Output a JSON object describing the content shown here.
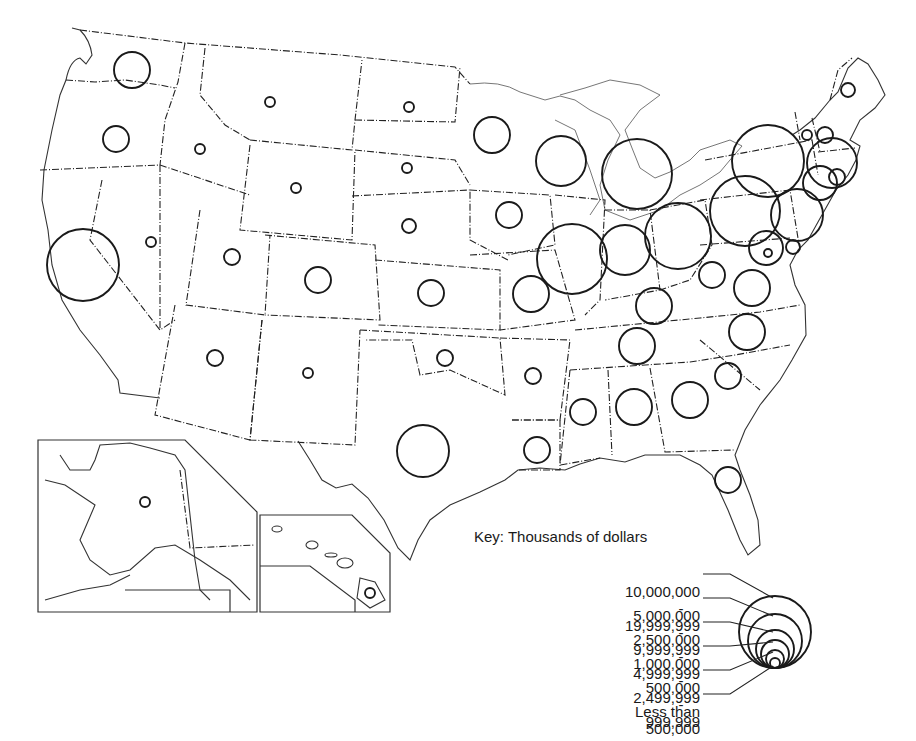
{
  "map": {
    "subject": "United States, by state — proportional circles",
    "insets": [
      "Alaska",
      "Hawaii"
    ]
  },
  "key": {
    "title": "Key:  Thousands of dollars",
    "rows": [
      {
        "low": "10,000,000",
        "sep": "-",
        "high": "19,999,999",
        "radius": 36
      },
      {
        "low": "5,000,000",
        "sep": "-",
        "high": "9,999,999",
        "radius": 27
      },
      {
        "low": "2,500,000",
        "sep": "-",
        "high": "4,999,999",
        "radius": 19
      },
      {
        "low": "1,000,000",
        "sep": "-",
        "high": "2,499,999",
        "radius": 14
      },
      {
        "low": "500,000",
        "sep": "-",
        "high": "999,999",
        "radius": 9
      },
      {
        "low": "Less than",
        "sep": "",
        "high": "500,000",
        "radius": 5
      }
    ]
  },
  "chart_data": {
    "type": "proportional-symbol-map",
    "title": "Key: Thousands of dollars",
    "legend": [
      "10,000,000 - 19,999,999",
      "5,000,000 - 9,999,999",
      "2,500,000 - 4,999,999",
      "1,000,000 - 2,499,999",
      "500,000 - 999,999",
      "Less than 500,000"
    ],
    "states": [
      {
        "state": "California",
        "class": "10,000,000 - 19,999,999",
        "cx": 83,
        "cy": 265,
        "r": 36
      },
      {
        "state": "New York",
        "class": "10,000,000 - 19,999,999",
        "cx": 768,
        "cy": 161,
        "r": 36
      },
      {
        "state": "Michigan",
        "class": "5,000,000 - 9,999,999",
        "cx": 637,
        "cy": 174,
        "r": 35
      },
      {
        "state": "Pennsylvania",
        "class": "5,000,000 - 9,999,999",
        "cx": 745,
        "cy": 211,
        "r": 35
      },
      {
        "state": "Illinois",
        "class": "5,000,000 - 9,999,999",
        "cx": 572,
        "cy": 259,
        "r": 35
      },
      {
        "state": "Ohio",
        "class": "5,000,000 - 9,999,999",
        "cx": 678,
        "cy": 236,
        "r": 33
      },
      {
        "state": "Texas",
        "class": "2,500,000 - 4,999,999",
        "cx": 423,
        "cy": 451,
        "r": 26
      },
      {
        "state": "Indiana",
        "class": "2,500,000 - 4,999,999",
        "cx": 625,
        "cy": 250,
        "r": 25
      },
      {
        "state": "Wisconsin",
        "class": "2,500,000 - 4,999,999",
        "cx": 561,
        "cy": 161,
        "r": 25
      },
      {
        "state": "New Jersey",
        "class": "2,500,000 - 4,999,999",
        "cx": 797,
        "cy": 215,
        "r": 26
      },
      {
        "state": "Massachusetts",
        "class": "2,500,000 - 4,999,999",
        "cx": 832,
        "cy": 163,
        "r": 25
      },
      {
        "state": "Connecticut",
        "class": "1,000,000 - 2,499,999",
        "cx": 820,
        "cy": 183,
        "r": 17
      },
      {
        "state": "Maryland",
        "class": "1,000,000 - 2,499,999",
        "cx": 766,
        "cy": 248,
        "r": 17
      },
      {
        "state": "Minnesota",
        "class": "1,000,000 - 2,499,999",
        "cx": 492,
        "cy": 135,
        "r": 18
      },
      {
        "state": "Washington",
        "class": "1,000,000 - 2,499,999",
        "cx": 132,
        "cy": 70,
        "r": 18
      },
      {
        "state": "Missouri",
        "class": "1,000,000 - 2,499,999",
        "cx": 531,
        "cy": 294,
        "r": 18
      },
      {
        "state": "Kentucky",
        "class": "1,000,000 - 2,499,999",
        "cx": 654,
        "cy": 306,
        "r": 18
      },
      {
        "state": "Virginia",
        "class": "1,000,000 - 2,499,999",
        "cx": 752,
        "cy": 288,
        "r": 18
      },
      {
        "state": "North Carolina",
        "class": "1,000,000 - 2,499,999",
        "cx": 747,
        "cy": 332,
        "r": 18
      },
      {
        "state": "Tennessee",
        "class": "1,000,000 - 2,499,999",
        "cx": 637,
        "cy": 346,
        "r": 18
      },
      {
        "state": "Alabama",
        "class": "1,000,000 - 2,499,999",
        "cx": 634,
        "cy": 407,
        "r": 18
      },
      {
        "state": "Georgia",
        "class": "1,000,000 - 2,499,999",
        "cx": 690,
        "cy": 400,
        "r": 18
      },
      {
        "state": "Oregon",
        "class": "500,000 - 999,999",
        "cx": 116,
        "cy": 139,
        "r": 13
      },
      {
        "state": "Iowa",
        "class": "500,000 - 999,999",
        "cx": 509,
        "cy": 215,
        "r": 13
      },
      {
        "state": "Kansas",
        "class": "500,000 - 999,999",
        "cx": 431,
        "cy": 293,
        "r": 13
      },
      {
        "state": "Colorado",
        "class": "500,000 - 999,999",
        "cx": 318,
        "cy": 280,
        "r": 13
      },
      {
        "state": "West Virginia",
        "class": "500,000 - 999,999",
        "cx": 712,
        "cy": 275,
        "r": 13
      },
      {
        "state": "South Carolina",
        "class": "500,000 - 999,999",
        "cx": 728,
        "cy": 376,
        "r": 13
      },
      {
        "state": "Mississippi",
        "class": "500,000 - 999,999",
        "cx": 583,
        "cy": 412,
        "r": 13
      },
      {
        "state": "Louisiana",
        "class": "500,000 - 999,999",
        "cx": 537,
        "cy": 450,
        "r": 13
      },
      {
        "state": "Florida",
        "class": "500,000 - 999,999",
        "cx": 728,
        "cy": 480,
        "r": 13
      },
      {
        "state": "Rhode Island",
        "class": "500,000 - 999,999",
        "cx": 837,
        "cy": 177,
        "r": 8
      },
      {
        "state": "New Hampshire",
        "class": "500,000 - 999,999",
        "cx": 825,
        "cy": 135,
        "r": 8
      },
      {
        "state": "Delaware",
        "class": "Less than 500,000",
        "cx": 793,
        "cy": 247,
        "r": 7
      },
      {
        "state": "Utah",
        "class": "Less than 500,000",
        "cx": 232,
        "cy": 257,
        "r": 8
      },
      {
        "state": "Arizona",
        "class": "Less than 500,000",
        "cx": 215,
        "cy": 358,
        "r": 8
      },
      {
        "state": "Oklahoma",
        "class": "Less than 500,000",
        "cx": 445,
        "cy": 358,
        "r": 8
      },
      {
        "state": "Arkansas",
        "class": "Less than 500,000",
        "cx": 533,
        "cy": 376,
        "r": 8
      },
      {
        "state": "Nebraska",
        "class": "Less than 500,000",
        "cx": 409,
        "cy": 226,
        "r": 7
      },
      {
        "state": "Maine",
        "class": "Less than 500,000",
        "cx": 848,
        "cy": 90,
        "r": 7
      },
      {
        "state": "Vermont",
        "class": "Less than 500,000",
        "cx": 807,
        "cy": 135,
        "r": 5
      },
      {
        "state": "Montana",
        "class": "Less than 500,000",
        "cx": 270,
        "cy": 102,
        "r": 5
      },
      {
        "state": "Idaho",
        "class": "Less than 500,000",
        "cx": 200,
        "cy": 149,
        "r": 5
      },
      {
        "state": "Wyoming",
        "class": "Less than 500,000",
        "cx": 296,
        "cy": 188,
        "r": 5
      },
      {
        "state": "Nevada",
        "class": "Less than 500,000",
        "cx": 151,
        "cy": 242,
        "r": 5
      },
      {
        "state": "New Mexico",
        "class": "Less than 500,000",
        "cx": 308,
        "cy": 373,
        "r": 5
      },
      {
        "state": "North Dakota",
        "class": "Less than 500,000",
        "cx": 409,
        "cy": 107,
        "r": 5
      },
      {
        "state": "South Dakota",
        "class": "Less than 500,000",
        "cx": 407,
        "cy": 168,
        "r": 5
      },
      {
        "state": "District of Columbia",
        "class": "Less than 500,000",
        "cx": 768,
        "cy": 253,
        "r": 4
      },
      {
        "state": "Alaska",
        "class": "Less than 500,000",
        "cx": 145,
        "cy": 502,
        "r": 5
      },
      {
        "state": "Hawaii",
        "class": "Less than 500,000",
        "cx": 370,
        "cy": 593,
        "r": 5
      }
    ]
  }
}
